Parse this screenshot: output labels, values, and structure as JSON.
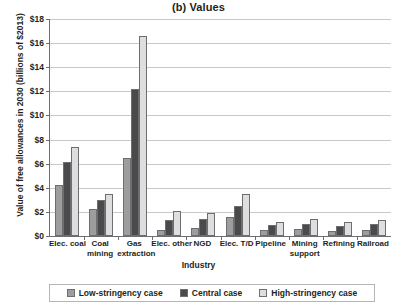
{
  "chart_data": {
    "type": "bar",
    "title": "(b) Values",
    "xlabel": "Industry",
    "ylabel": "Value of free allowances in 2030 (billions of $2013)",
    "ylim": [
      0,
      18
    ],
    "ytick_step": 2,
    "ytick_labels": [
      "$0",
      "$2",
      "$4",
      "$6",
      "$8",
      "$10",
      "$12",
      "$14",
      "$16",
      "$18"
    ],
    "grid": true,
    "legend_position": "bottom",
    "categories": [
      "Elec. coal",
      "Coal mining",
      "Gas extraction",
      "Elec. other",
      "NGD",
      "Elec. T/D",
      "Pipeline",
      "Mining support",
      "Refining",
      "Railroad"
    ],
    "category_lines": [
      [
        "Elec. coal",
        ""
      ],
      [
        "Coal",
        "mining"
      ],
      [
        "Gas",
        "extraction"
      ],
      [
        "Elec. other",
        ""
      ],
      [
        "NGD",
        ""
      ],
      [
        "Elec. T/D",
        ""
      ],
      [
        "Pipeline",
        ""
      ],
      [
        "Mining",
        "support"
      ],
      [
        "Refining",
        ""
      ],
      [
        "Railroad",
        ""
      ]
    ],
    "series": [
      {
        "name": "Low-stringency case",
        "color": "#9d9d9d",
        "values": [
          4.2,
          2.2,
          6.5,
          0.5,
          0.7,
          1.6,
          0.5,
          0.6,
          0.4,
          0.5
        ]
      },
      {
        "name": "Central case",
        "color": "#4a4a4a",
        "values": [
          6.1,
          3.0,
          12.2,
          1.3,
          1.4,
          2.5,
          0.9,
          1.0,
          0.8,
          1.0
        ]
      },
      {
        "name": "High-stringency case",
        "color": "#dedede",
        "values": [
          7.4,
          3.5,
          16.6,
          2.1,
          1.9,
          3.5,
          1.2,
          1.4,
          1.2,
          1.3
        ]
      }
    ]
  },
  "legend": {
    "items": [
      {
        "label": "Low-stringency case"
      },
      {
        "label": "Central case"
      },
      {
        "label": "High-stringency case"
      }
    ]
  }
}
